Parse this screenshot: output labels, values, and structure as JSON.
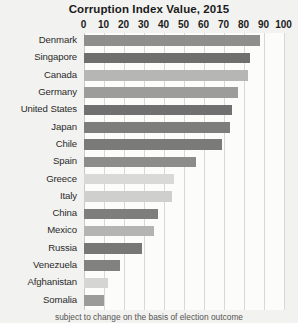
{
  "chart_data": {
    "type": "bar",
    "orientation": "horizontal",
    "title": "Corruption Index Value, 2015",
    "xlabel": "",
    "ylabel": "",
    "xlim": [
      0,
      100
    ],
    "xticks": [
      0,
      10,
      20,
      30,
      40,
      50,
      60,
      70,
      80,
      90,
      100
    ],
    "grid": true,
    "legend": "none",
    "categories": [
      "Denmark",
      "Singapore",
      "Canada",
      "Germany",
      "United States",
      "Japan",
      "Chile",
      "Spain",
      "Greece",
      "Italy",
      "China",
      "Mexico",
      "Russia",
      "Venezuela",
      "Afghanistan",
      "Somalia"
    ],
    "values": [
      88,
      83,
      82,
      77,
      74,
      73,
      69,
      56,
      45,
      44,
      37,
      35,
      29,
      18,
      12,
      10
    ],
    "bar_colors": [
      "#8e8e8c",
      "#6f6f6d",
      "#b6b6b4",
      "#9c9c9a",
      "#707070",
      "#7d7d7b",
      "#7a7a78",
      "#8c8c8a",
      "#d9d9d7",
      "#cfcfcd",
      "#7e7e7c",
      "#b4b4b2",
      "#77777 5",
      "#818180",
      "#d5d5d3",
      "#9b9b99"
    ]
  },
  "footer": {
    "note": "subject to change on the basis of election outcome"
  }
}
